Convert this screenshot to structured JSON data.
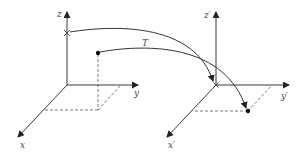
{
  "diagram": {
    "type": "coordinate-transformation",
    "colors": {
      "line": "#3a3a3a",
      "dashed": "#555555",
      "background": "#ffffff"
    },
    "left_frame": {
      "axes": {
        "z": "z",
        "y": "y",
        "x": "x"
      },
      "marker_on_z": "cross",
      "point": "filled-dot"
    },
    "right_frame": {
      "axes": {
        "z": "z′",
        "y": "y′",
        "x": "x′"
      },
      "marker_at_origin": "cross",
      "point": "filled-dot"
    },
    "transformation_label": "T",
    "arrows": [
      {
        "from": "left z-axis cross",
        "to": "right frame origin"
      },
      {
        "from": "left point",
        "to": "right point"
      }
    ]
  }
}
